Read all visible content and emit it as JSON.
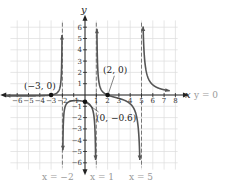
{
  "chart_data": {
    "type": "line",
    "title": "",
    "xlabel": "x",
    "ylabel": "y",
    "xlim": [
      -6,
      8
    ],
    "ylim": [
      -6,
      6
    ],
    "grid": true,
    "x_ticks": [
      "-6",
      "-5",
      "-4",
      "-3",
      "-2",
      "-1",
      "1",
      "2",
      "3",
      "4",
      "5",
      "6",
      "7",
      "8"
    ],
    "y_ticks": [
      "6",
      "5",
      "4",
      "3",
      "2",
      "1",
      "-1",
      "-2",
      "-3",
      "-4",
      "-5",
      "-6"
    ],
    "vertical_asymptotes": [
      -2,
      1,
      5
    ],
    "horizontal_asymptote": 0,
    "points": [
      {
        "x": -3,
        "y": 0,
        "label": "(−3, 0)"
      },
      {
        "x": 2,
        "y": 0,
        "label": "(2, 0)"
      },
      {
        "x": 0,
        "y": -0.6,
        "label": "(0, −0.6)"
      }
    ],
    "annotations": {
      "x_axis": "x",
      "y_axis": "y",
      "h_asymptote": "y = 0",
      "v_asymptote_1": "x = −2",
      "v_asymptote_2": "x = 1",
      "v_asymptote_3": "x = 5"
    },
    "colors": {
      "curve": "#555555",
      "grid": "#dddddd",
      "axis": "#222222",
      "asymptote": "#777777",
      "asymptote_label": "#999999"
    }
  }
}
